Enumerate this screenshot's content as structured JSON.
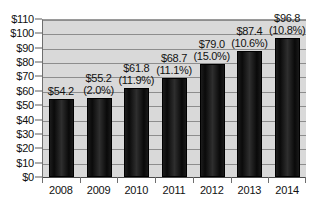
{
  "chart_data": {
    "type": "bar",
    "title": "",
    "xlabel": "",
    "ylabel": "",
    "categories": [
      "2008",
      "2009",
      "2010",
      "2011",
      "2012",
      "2013",
      "2014"
    ],
    "values": [
      54.2,
      55.2,
      61.8,
      68.7,
      79.0,
      87.4,
      96.8
    ],
    "value_labels": [
      "$54.2",
      "$55.2",
      "$61.8",
      "$68.7",
      "$79.0",
      "$87.4",
      "$96.8"
    ],
    "growth_labels": [
      "",
      "(2.0%)",
      "(11.9%)",
      "(11.1%)",
      "(15.0%)",
      "(10.6%)",
      "(10.8%)"
    ],
    "ylim": [
      0,
      110
    ],
    "ytick_step": 10,
    "ytick_labels": [
      "$110",
      "$100",
      "$90",
      "$80",
      "$70",
      "$60",
      "$50",
      "$40",
      "$30",
      "$20",
      "$10",
      "$0"
    ],
    "ytick_values": [
      110,
      100,
      90,
      80,
      70,
      60,
      50,
      40,
      30,
      20,
      10,
      0
    ],
    "grid": true,
    "grid_axis": "y",
    "legend": false,
    "legend_position": "none",
    "colors": {
      "bar": "#0a0a0a",
      "plot_background": "#d9d9d9",
      "page_background": "#ffffff",
      "gridline": "#8d8d8d",
      "axis": "#4a4a4a",
      "text": "#111111"
    }
  }
}
